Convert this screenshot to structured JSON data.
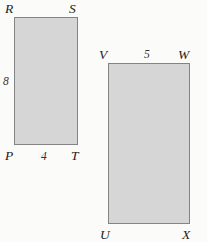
{
  "figure": {
    "background_color": "#fbfbfa",
    "shape_fill_color": "#d6d6d6",
    "shape_border_color": "#848484",
    "label_color": "#1b1b1b",
    "shapes": [
      {
        "id": "rect-prst",
        "kind": "rectangle",
        "vertices": [
          {
            "key": "r",
            "label": "R",
            "corner": "top-left"
          },
          {
            "key": "s",
            "label": "S",
            "corner": "top-right"
          },
          {
            "key": "p",
            "label": "P",
            "corner": "bottom-left"
          },
          {
            "key": "t",
            "label": "T",
            "corner": "bottom-right"
          }
        ],
        "measures": [
          {
            "key": "height",
            "label": "8",
            "side": "left"
          },
          {
            "key": "width",
            "label": "4",
            "side": "bottom"
          }
        ]
      },
      {
        "id": "rect-uvwx",
        "kind": "rectangle",
        "vertices": [
          {
            "key": "v",
            "label": "V",
            "corner": "top-left"
          },
          {
            "key": "w",
            "label": "W",
            "corner": "top-right"
          },
          {
            "key": "u",
            "label": "U",
            "corner": "bottom-left"
          },
          {
            "key": "x",
            "label": "X",
            "corner": "bottom-right"
          }
        ],
        "measures": [
          {
            "key": "width",
            "label": "5",
            "side": "top"
          }
        ]
      }
    ]
  }
}
